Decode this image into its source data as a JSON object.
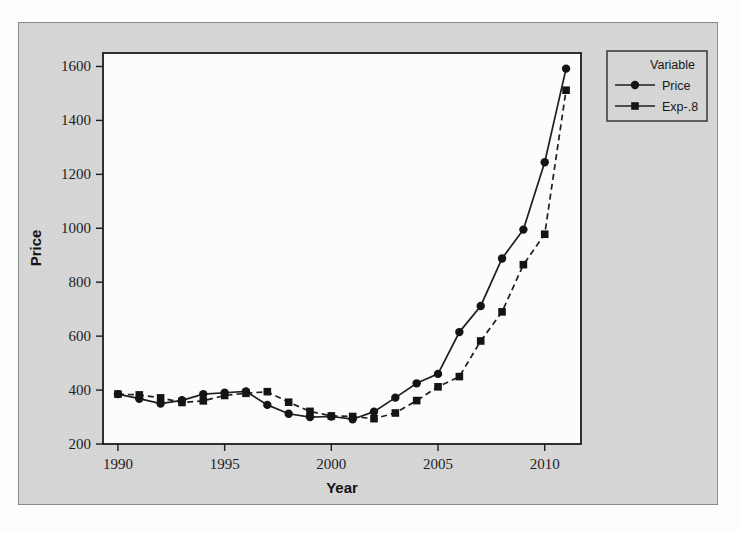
{
  "figure": {
    "background_color": "#d8d8d8",
    "plot_background_color": "#ffffff",
    "line_color": "#1c1c1c"
  },
  "chart_data": {
    "type": "line",
    "title": "",
    "xlabel": "Year",
    "ylabel": "Price",
    "xlim": [
      1989.3,
      2011.7
    ],
    "ylim": [
      200,
      1650
    ],
    "xticks": [
      1990,
      1995,
      2000,
      2005,
      2010
    ],
    "xtick_labels": [
      "1990",
      "1995",
      "2000",
      "2005",
      "2010"
    ],
    "yticks": [
      200,
      400,
      600,
      800,
      1000,
      1200,
      1400,
      1600
    ],
    "ytick_labels": [
      "200",
      "400",
      "600",
      "800",
      "1000",
      "1200",
      "1400",
      "1600"
    ],
    "grid": false,
    "legend_position": "outside-top-right",
    "legend_title": "Variable",
    "x": [
      1990,
      1991,
      1992,
      1993,
      1994,
      1995,
      1996,
      1997,
      1998,
      1999,
      2000,
      2001,
      2002,
      2003,
      2004,
      2005,
      2006,
      2007,
      2008,
      2009,
      2010,
      2011
    ],
    "series": [
      {
        "name": "Price",
        "marker": "circle",
        "linestyle": "solid",
        "values": [
          385,
          368,
          350,
          362,
          385,
          390,
          395,
          345,
          312,
          300,
          302,
          292,
          320,
          372,
          425,
          460,
          615,
          712,
          888,
          995,
          1245,
          1592
        ]
      },
      {
        "name": "Exp-.8",
        "marker": "square",
        "linestyle": "dashed",
        "values": [
          385,
          382,
          371,
          354,
          360,
          380,
          388,
          394,
          355,
          321,
          304,
          302,
          294,
          315,
          361,
          412,
          450,
          582,
          690,
          865,
          978,
          1512
        ]
      }
    ]
  },
  "legend": {
    "title": "Variable",
    "entries": [
      {
        "label": "Price",
        "marker": "circle",
        "linestyle": "solid"
      },
      {
        "label": "Exp-.8",
        "marker": "square",
        "linestyle": "dashed"
      }
    ]
  }
}
